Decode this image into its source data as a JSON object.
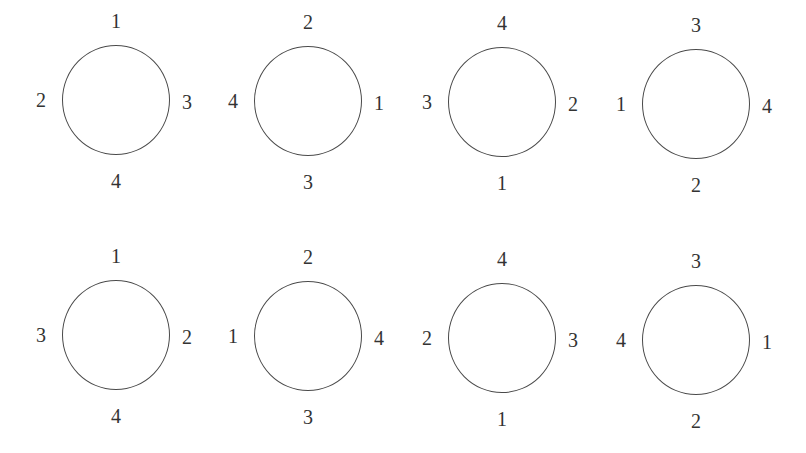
{
  "diagram": {
    "rows": [
      {
        "circles": [
          {
            "top": "1",
            "left": "2",
            "right": "3",
            "bottom": "4"
          },
          {
            "top": "2",
            "left": "4",
            "right": "1",
            "bottom": "3"
          },
          {
            "top": "4",
            "left": "3",
            "right": "2",
            "bottom": "1"
          },
          {
            "top": "3",
            "left": "1",
            "right": "4",
            "bottom": "2"
          }
        ]
      },
      {
        "circles": [
          {
            "top": "1",
            "left": "3",
            "right": "2",
            "bottom": "4"
          },
          {
            "top": "2",
            "left": "1",
            "right": "4",
            "bottom": "3"
          },
          {
            "top": "4",
            "left": "2",
            "right": "3",
            "bottom": "1"
          },
          {
            "top": "3",
            "left": "4",
            "right": "1",
            "bottom": "2"
          }
        ]
      }
    ],
    "colors": {
      "stroke": "#4a4a4a",
      "text": "#333333",
      "background": "#ffffff"
    }
  }
}
